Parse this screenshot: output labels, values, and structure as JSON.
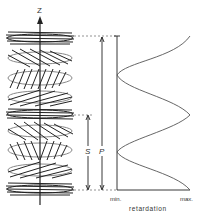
{
  "diagram": {
    "axis_label": "Z",
    "period_label": "P",
    "half_period_label": "S",
    "x_axis": {
      "label": "retardation",
      "min_label": "min.",
      "max_label": "max."
    },
    "colors": {
      "ink": "#222222",
      "curve": "#555555",
      "dashed": "#777777"
    }
  }
}
